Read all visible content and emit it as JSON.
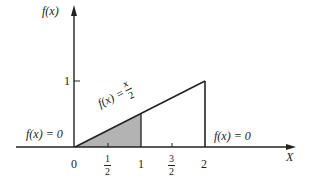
{
  "diagram": {
    "y_axis_label": "f(x)",
    "x_axis_label": "X",
    "y_tick_1": "1",
    "x_ticks": {
      "zero": "0",
      "half_num": "1",
      "half_den": "2",
      "one": "1",
      "three_half_num": "3",
      "three_half_den": "2",
      "two": "2"
    },
    "left_label": "f(x) = 0",
    "right_label": "f(x) = 0",
    "line_label_prefix": "f(x) =",
    "line_label_num": "x",
    "line_label_den": "2",
    "shaded_region": {
      "from": 0,
      "to": 1,
      "color": "#b3b3b3"
    },
    "function": "f(x) = x/2 on [0,2], 0 elsewhere"
  }
}
